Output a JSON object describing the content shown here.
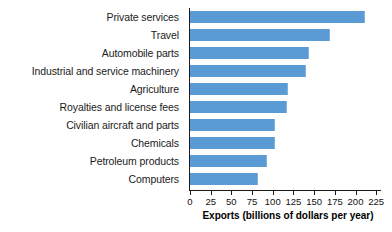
{
  "chart_data": {
    "type": "bar",
    "orientation": "horizontal",
    "title": "",
    "xlabel": "Exports (billions of dollars per year)",
    "ylabel": "",
    "xlim": [
      0,
      232
    ],
    "xticks": [
      0,
      25,
      50,
      75,
      100,
      125,
      150,
      175,
      200,
      225
    ],
    "grid": false,
    "legend": null,
    "bar_color": "#5b9bd5",
    "axis_color": "#1a1a1a",
    "categories": [
      "Private services",
      "Travel",
      "Automobile parts",
      "Industrial and service machinery",
      "Agriculture",
      "Royalties and license fees",
      "Civilian aircraft and parts",
      "Chemicals",
      "Petroleum products",
      "Computers"
    ],
    "values": [
      210,
      168,
      142,
      139,
      117,
      116,
      102,
      101,
      92,
      81
    ]
  }
}
